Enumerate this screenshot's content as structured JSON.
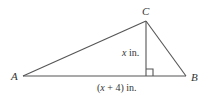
{
  "diagram": {
    "type": "triangle-with-altitude",
    "vertices": {
      "A": {
        "label": "A",
        "x": 23,
        "y": 76
      },
      "B": {
        "label": "B",
        "x": 186,
        "y": 76
      },
      "C": {
        "label": "C",
        "x": 146,
        "y": 21
      }
    },
    "altitude": {
      "from": "C",
      "foot_x": 146,
      "foot_y": 76,
      "label_var": "x",
      "label_unit": " in."
    },
    "base": {
      "label_open": "(",
      "label_var": "x",
      "label_rest": " + 4) in."
    },
    "colors": {
      "stroke": "#555555",
      "text": "#333333"
    }
  }
}
